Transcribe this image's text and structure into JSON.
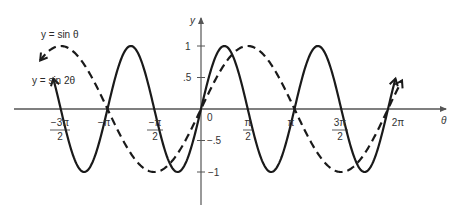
{
  "chart_data": {
    "type": "line",
    "title": "",
    "xlabel": "θ",
    "ylabel": "y",
    "xlim": [
      -1.75,
      2.3
    ],
    "xlim_units": "multiples of π",
    "ylim": [
      -1.25,
      1.35
    ],
    "grid": false,
    "legend_position": "inline labels, upper-left",
    "x_ticks": [
      {
        "value": -1.5,
        "label_num": "−3π",
        "label_den": "2"
      },
      {
        "value": -1.0,
        "label": "−π"
      },
      {
        "value": -0.5,
        "label_num": "−π",
        "label_den": "2"
      },
      {
        "value": 0,
        "label": "0"
      },
      {
        "value": 0.5,
        "label_num": "π",
        "label_den": "2"
      },
      {
        "value": 1.0,
        "label": "π"
      },
      {
        "value": 1.5,
        "label_num": "3π",
        "label_den": "2"
      },
      {
        "value": 2.0,
        "label": "2π"
      }
    ],
    "y_ticks": [
      {
        "value": 1,
        "label": "1"
      },
      {
        "value": 0.5,
        "label": ".5"
      },
      {
        "value": -0.5,
        "label": "−.5"
      },
      {
        "value": -1,
        "label": "−1"
      }
    ],
    "series": [
      {
        "name": "y = sin θ",
        "style": "dashed",
        "function": "sin(x)",
        "x_range_pi": [
          -1.72,
          2.15
        ],
        "points": [
          [
            -1.5,
            1
          ],
          [
            -1,
            0
          ],
          [
            -0.5,
            -1
          ],
          [
            0,
            0
          ],
          [
            0.5,
            1
          ],
          [
            1,
            0
          ],
          [
            1.5,
            -1
          ],
          [
            2,
            0
          ]
        ]
      },
      {
        "name": "y = sin 2θ",
        "style": "solid",
        "function": "sin(2x)",
        "x_range_pi": [
          -1.58,
          2.08
        ],
        "points": [
          [
            -1.5,
            0
          ],
          [
            -1.25,
            -1
          ],
          [
            -1,
            0
          ],
          [
            -0.75,
            1
          ],
          [
            -0.5,
            0
          ],
          [
            -0.25,
            -1
          ],
          [
            0,
            0
          ],
          [
            0.25,
            1
          ],
          [
            0.5,
            0
          ],
          [
            0.75,
            -1
          ],
          [
            1,
            0
          ],
          [
            1.25,
            1
          ],
          [
            1.5,
            0
          ],
          [
            1.75,
            -1
          ],
          [
            2,
            0
          ]
        ]
      }
    ],
    "annotations": [
      "y = sin θ",
      "y = sin 2θ"
    ]
  },
  "labels": {
    "y_axis": "y",
    "x_axis": "θ",
    "sin_theta": "y = sin θ",
    "sin_2theta": "y = sin 2θ",
    "tick_neg3pi2_num": "−3π",
    "tick_neg3pi2_den": "2",
    "tick_negpi": "−π",
    "tick_negpi2_num": "−π",
    "tick_negpi2_den": "2",
    "tick_zero": "0",
    "tick_pi2_num": "π",
    "tick_pi2_den": "2",
    "tick_pi": "π",
    "tick_3pi2_num": "3π",
    "tick_3pi2_den": "2",
    "tick_2pi": "2π",
    "ytick_1": "1",
    "ytick_05": ".5",
    "ytick_neg05": "−.5",
    "ytick_neg1": "−1"
  },
  "colors": {
    "axis": "#555555",
    "curve": "#1a1a1a",
    "text": "#333333"
  }
}
